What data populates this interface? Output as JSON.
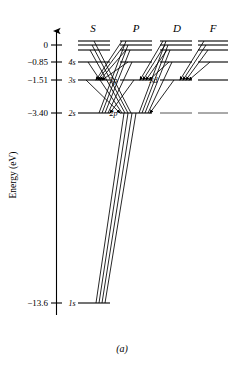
{
  "figure": {
    "caption": "(a)",
    "axis_title": "Energy (eV)"
  },
  "chart_data": {
    "type": "line",
    "xlabel": "",
    "ylabel": "Energy (eV)",
    "ylim": [
      -13.6,
      0.4
    ],
    "grid": false,
    "legend": "none",
    "axis_ticks": [
      {
        "label": "0",
        "value": 0
      },
      {
        "label": "−0.85",
        "value": -0.85
      },
      {
        "label": "−1.51",
        "value": -1.51
      },
      {
        "label": "−3.40",
        "value": -3.4
      },
      {
        "label": "−13.6",
        "value": -13.6
      }
    ],
    "columns": [
      {
        "header": "S",
        "x": 93
      },
      {
        "header": "P",
        "x": 136
      },
      {
        "header": "D",
        "x": 177
      },
      {
        "header": "F",
        "x": 213
      }
    ],
    "levels": [
      {
        "column": "S",
        "n": 7,
        "value": -0.28,
        "label": "",
        "x1": 78,
        "x2": 110,
        "y": 41
      },
      {
        "column": "S",
        "n": 6,
        "value": -0.38,
        "label": "",
        "x1": 78,
        "x2": 110,
        "y": 45
      },
      {
        "column": "S",
        "n": 5,
        "value": -0.54,
        "label": "",
        "x1": 78,
        "x2": 110,
        "y": 50
      },
      {
        "column": "S",
        "n": 4,
        "value": -0.85,
        "label": "4s",
        "x1": 78,
        "x2": 110,
        "y": 62
      },
      {
        "column": "S",
        "n": 3,
        "value": -1.51,
        "label": "3s",
        "x1": 78,
        "x2": 110,
        "y": 80
      },
      {
        "column": "S",
        "n": 2,
        "value": -3.4,
        "label": "2s",
        "x1": 78,
        "x2": 110,
        "y": 113
      },
      {
        "column": "S",
        "n": 1,
        "value": -13.6,
        "label": "1s",
        "x1": 78,
        "x2": 110,
        "y": 303
      },
      {
        "column": "P",
        "n": 7,
        "value": -0.28,
        "label": "",
        "x1": 120,
        "x2": 152,
        "y": 41
      },
      {
        "column": "P",
        "n": 6,
        "value": -0.38,
        "label": "",
        "x1": 120,
        "x2": 152,
        "y": 45
      },
      {
        "column": "P",
        "n": 5,
        "value": -0.54,
        "label": "",
        "x1": 120,
        "x2": 152,
        "y": 50
      },
      {
        "column": "P",
        "n": 4,
        "value": -0.85,
        "label": "",
        "x1": 120,
        "x2": 152,
        "y": 62
      },
      {
        "column": "P",
        "n": 3,
        "value": -1.51,
        "label": "3p",
        "x1": 120,
        "x2": 152,
        "y": 80
      },
      {
        "column": "P",
        "n": 2,
        "value": -3.4,
        "label": "2p",
        "x1": 120,
        "x2": 152,
        "y": 113
      },
      {
        "column": "D",
        "n": 7,
        "value": -0.28,
        "label": "",
        "x1": 160,
        "x2": 192,
        "y": 41
      },
      {
        "column": "D",
        "n": 6,
        "value": -0.38,
        "label": "",
        "x1": 160,
        "x2": 192,
        "y": 45
      },
      {
        "column": "D",
        "n": 5,
        "value": -0.54,
        "label": "",
        "x1": 160,
        "x2": 192,
        "y": 50
      },
      {
        "column": "D",
        "n": 4,
        "value": -0.85,
        "label": "",
        "x1": 160,
        "x2": 192,
        "y": 62
      },
      {
        "column": "D",
        "n": 3,
        "value": -1.51,
        "label": "3d",
        "x1": 160,
        "x2": 192,
        "y": 80
      },
      {
        "column": "D",
        "n": 2,
        "value": -3.4,
        "label": "",
        "x1": 160,
        "x2": 192,
        "y": 113
      },
      {
        "column": "F",
        "n": 7,
        "value": -0.28,
        "label": "",
        "x1": 198,
        "x2": 228,
        "y": 41
      },
      {
        "column": "F",
        "n": 6,
        "value": -0.38,
        "label": "",
        "x1": 198,
        "x2": 228,
        "y": 45
      },
      {
        "column": "F",
        "n": 5,
        "value": -0.54,
        "label": "",
        "x1": 198,
        "x2": 228,
        "y": 50
      },
      {
        "column": "F",
        "n": 4,
        "value": -0.85,
        "label": "",
        "x1": 198,
        "x2": 228,
        "y": 62
      },
      {
        "column": "F",
        "n": 3,
        "value": -1.51,
        "label": "",
        "x1": 198,
        "x2": 228,
        "y": 80
      },
      {
        "column": "F",
        "n": 2,
        "value": -3.4,
        "label": "",
        "x1": 198,
        "x2": 228,
        "y": 113
      }
    ],
    "transitions": [
      {
        "from": "S7",
        "to": "P2",
        "x1": 94,
        "y1": 41,
        "x2": 131,
        "y2": 113
      },
      {
        "from": "S6",
        "to": "P2",
        "x1": 92,
        "y1": 45,
        "x2": 128,
        "y2": 113
      },
      {
        "from": "S5",
        "to": "P2",
        "x1": 90,
        "y1": 50,
        "x2": 125,
        "y2": 113
      },
      {
        "from": "S4",
        "to": "P2",
        "x1": 88,
        "y1": 62,
        "x2": 122,
        "y2": 113
      },
      {
        "from": "S3",
        "to": "P2",
        "x1": 86,
        "y1": 80,
        "x2": 120,
        "y2": 113
      },
      {
        "from": "P7",
        "to": "S2",
        "x1": 126,
        "y1": 41,
        "x2": 99,
        "y2": 113
      },
      {
        "from": "P6",
        "to": "S2",
        "x1": 128,
        "y1": 45,
        "x2": 102,
        "y2": 113
      },
      {
        "from": "P5",
        "to": "S2",
        "x1": 130,
        "y1": 50,
        "x2": 105,
        "y2": 113
      },
      {
        "from": "P4",
        "to": "S2",
        "x1": 132,
        "y1": 62,
        "x2": 108,
        "y2": 113
      },
      {
        "from": "P3",
        "to": "S2",
        "x1": 134,
        "y1": 80,
        "x2": 110,
        "y2": 113
      },
      {
        "from": "P7",
        "to": "S3",
        "x1": 122,
        "y1": 41,
        "x2": 96,
        "y2": 80
      },
      {
        "from": "P6",
        "to": "S3",
        "x1": 124,
        "y1": 45,
        "x2": 98,
        "y2": 80
      },
      {
        "from": "P5",
        "to": "S3",
        "x1": 126,
        "y1": 50,
        "x2": 100,
        "y2": 80
      },
      {
        "from": "P4",
        "to": "S3",
        "x1": 128,
        "y1": 62,
        "x2": 102,
        "y2": 80
      },
      {
        "from": "D7",
        "to": "P2",
        "x1": 166,
        "y1": 41,
        "x2": 139,
        "y2": 113
      },
      {
        "from": "D6",
        "to": "P2",
        "x1": 168,
        "y1": 45,
        "x2": 142,
        "y2": 113
      },
      {
        "from": "D5",
        "to": "P2",
        "x1": 170,
        "y1": 50,
        "x2": 145,
        "y2": 113
      },
      {
        "from": "D4",
        "to": "P2",
        "x1": 172,
        "y1": 62,
        "x2": 148,
        "y2": 113
      },
      {
        "from": "D3",
        "to": "P2",
        "x1": 174,
        "y1": 80,
        "x2": 150,
        "y2": 113
      },
      {
        "from": "D7",
        "to": "P3",
        "x1": 163,
        "y1": 41,
        "x2": 140,
        "y2": 80
      },
      {
        "from": "D6",
        "to": "P3",
        "x1": 165,
        "y1": 45,
        "x2": 143,
        "y2": 80
      },
      {
        "from": "D5",
        "to": "P3",
        "x1": 167,
        "y1": 50,
        "x2": 146,
        "y2": 80
      },
      {
        "from": "D4",
        "to": "P3",
        "x1": 169,
        "y1": 62,
        "x2": 149,
        "y2": 80
      },
      {
        "from": "F7",
        "to": "D3",
        "x1": 204,
        "y1": 41,
        "x2": 180,
        "y2": 80
      },
      {
        "from": "F6",
        "to": "D3",
        "x1": 206,
        "y1": 45,
        "x2": 183,
        "y2": 80
      },
      {
        "from": "F5",
        "to": "D3",
        "x1": 208,
        "y1": 50,
        "x2": 186,
        "y2": 80
      },
      {
        "from": "F4",
        "to": "D3",
        "x1": 210,
        "y1": 62,
        "x2": 189,
        "y2": 80
      },
      {
        "from": "P2",
        "to": "S1",
        "x1": 124,
        "y1": 113,
        "x2": 96,
        "y2": 303
      },
      {
        "from": "P3",
        "to": "S1",
        "x1": 128,
        "y1": 113,
        "x2": 99,
        "y2": 303
      },
      {
        "from": "P4",
        "to": "S1",
        "x1": 132,
        "y1": 113,
        "x2": 102,
        "y2": 303
      },
      {
        "from": "P5",
        "to": "S1",
        "x1": 136,
        "y1": 113,
        "x2": 105,
        "y2": 303
      }
    ]
  }
}
